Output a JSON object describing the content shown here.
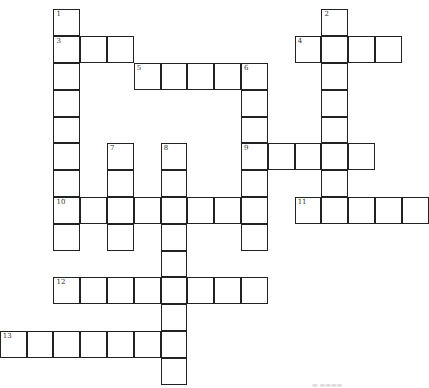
{
  "puzzle": {
    "cell_size": 26.8,
    "origin_x": 0.5,
    "origin_y": 10,
    "entries": [
      {
        "number": "1",
        "direction": "down",
        "row": 0,
        "col": 2,
        "length": 9
      },
      {
        "number": "2",
        "direction": "down",
        "row": 0,
        "col": 12,
        "length": 8
      },
      {
        "number": "3",
        "direction": "across",
        "row": 1,
        "col": 2,
        "length": 3
      },
      {
        "number": "4",
        "direction": "across",
        "row": 1,
        "col": 11,
        "length": 4
      },
      {
        "number": "5",
        "direction": "across",
        "row": 2,
        "col": 5,
        "length": 5
      },
      {
        "number": "6",
        "direction": "down",
        "row": 2,
        "col": 9,
        "length": 7
      },
      {
        "number": "7",
        "direction": "down",
        "row": 5,
        "col": 4,
        "length": 4
      },
      {
        "number": "8",
        "direction": "down",
        "row": 5,
        "col": 6,
        "length": 9
      },
      {
        "number": "9",
        "direction": "across",
        "row": 5,
        "col": 9,
        "length": 5
      },
      {
        "number": "10",
        "direction": "across",
        "row": 7,
        "col": 2,
        "length": 8
      },
      {
        "number": "11",
        "direction": "across",
        "row": 7,
        "col": 11,
        "length": 5
      },
      {
        "number": "12",
        "direction": "across",
        "row": 10,
        "col": 2,
        "length": 8
      },
      {
        "number": "13",
        "direction": "across",
        "row": 12,
        "col": 0,
        "length": 7
      }
    ]
  },
  "footer": {
    "watermark": "▬ ▬▬▬▬"
  }
}
